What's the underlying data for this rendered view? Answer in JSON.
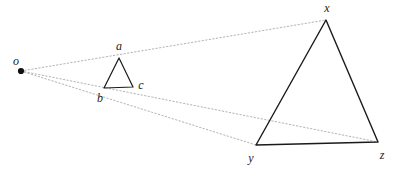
{
  "figure": {
    "type": "geometry-diagram",
    "background_color": "#ffffff",
    "stroke_color": "#1a1a1a",
    "projection_ray_color": "#b0b0b0",
    "width": 397,
    "height": 173
  },
  "points": {
    "o": {
      "label": "o",
      "x": 21,
      "y": 71,
      "label_x": 16,
      "label_y": 61,
      "dot": true
    },
    "a": {
      "label": "a",
      "x": 119,
      "y": 58,
      "label_x": 119,
      "label_y": 46,
      "dot": false
    },
    "b": {
      "label": "b",
      "x": 104,
      "y": 88,
      "label_x": 100,
      "label_y": 98,
      "dot": false
    },
    "c": {
      "label": "c",
      "x": 133,
      "y": 87,
      "label_x": 141,
      "label_y": 85,
      "dot": false
    },
    "x": {
      "label": "x",
      "x": 326,
      "y": 20,
      "label_x": 327,
      "label_y": 8,
      "dot": false
    },
    "y": {
      "label": "y",
      "x": 256,
      "y": 145,
      "label_x": 251,
      "label_y": 158,
      "dot": false
    },
    "z": {
      "label": "z",
      "x": 378,
      "y": 142,
      "label_x": 382,
      "label_y": 155,
      "dot": false
    }
  },
  "shapes": {
    "small_triangle": {
      "name": "triangle-abc",
      "vertices": [
        "a",
        "b",
        "c"
      ],
      "path": "119,58 104,88 133,87"
    },
    "large_triangle": {
      "name": "triangle-xyz",
      "vertices": [
        "x",
        "y",
        "z"
      ],
      "path": "326,20 256,145 378,142"
    }
  },
  "projection_rays": [
    {
      "name": "ray-o-a-x",
      "from": "o",
      "through": "a",
      "to": "x",
      "x1": 21,
      "y1": 71,
      "x2": 326,
      "y2": 20
    },
    {
      "name": "ray-o-c-z",
      "from": "o",
      "through": "c",
      "to": "z",
      "x1": 21,
      "y1": 71,
      "x2": 378,
      "y2": 142
    },
    {
      "name": "ray-o-b-y",
      "from": "o",
      "through": "b",
      "to": "y",
      "x1": 21,
      "y1": 71,
      "x2": 256,
      "y2": 145
    }
  ]
}
